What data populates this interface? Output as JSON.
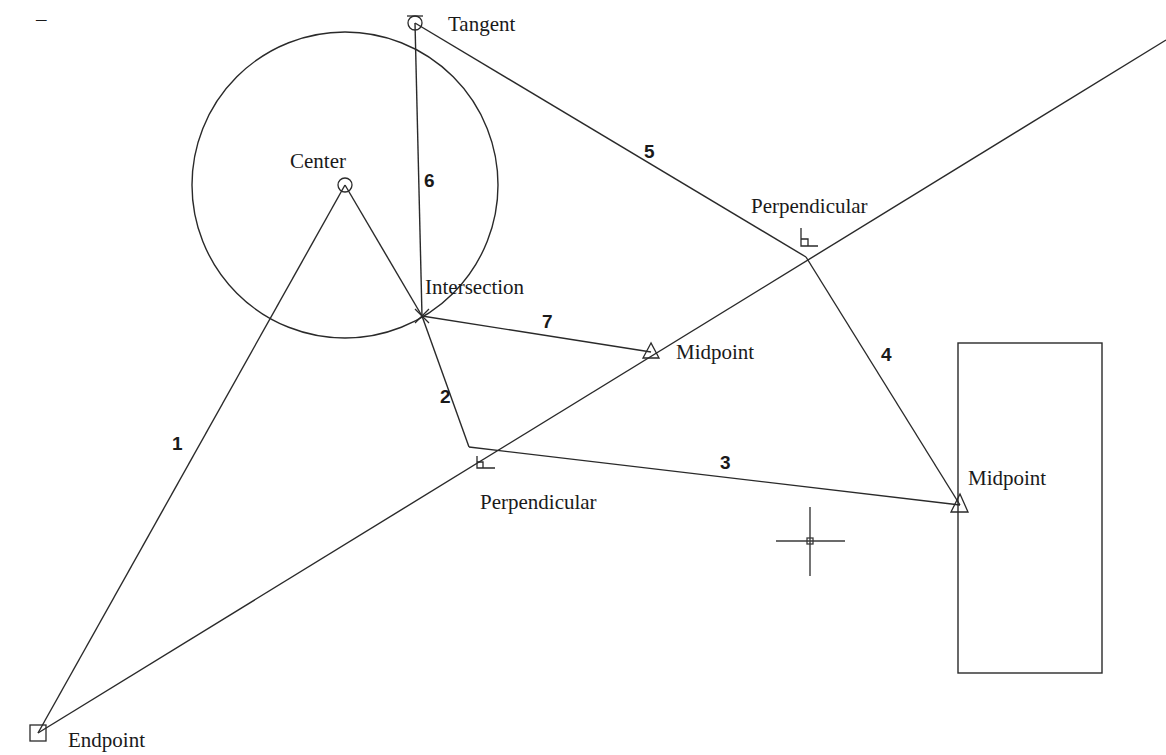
{
  "diagram": {
    "corner_mark": "–",
    "points": {
      "endpoint": {
        "label": "Endpoint",
        "x": 38,
        "y": 733,
        "marker": "square"
      },
      "center": {
        "label": "Center",
        "x": 345,
        "y": 185,
        "marker": "circle"
      },
      "tangent": {
        "label": "Tangent",
        "x": 415,
        "y": 23,
        "marker": "tangent-circle"
      },
      "intersection": {
        "label": "Intersection",
        "x": 422,
        "y": 316,
        "marker": "x"
      },
      "perpendicular_lower": {
        "label": "Perpendicular",
        "x": 469,
        "y": 447,
        "marker": "right-angle"
      },
      "perpendicular_upper": {
        "label": "Perpendicular",
        "x": 806,
        "y": 257,
        "marker": "right-angle"
      },
      "midpoint_line": {
        "label": "Midpoint",
        "x": 651,
        "y": 352,
        "marker": "triangle"
      },
      "midpoint_rect": {
        "label": "Midpoint",
        "x": 960,
        "y": 505,
        "marker": "triangle"
      }
    },
    "segments": [
      {
        "label": "1",
        "from": "endpoint",
        "to": "center"
      },
      {
        "label": "2",
        "from": "intersection",
        "to": "perpendicular_lower"
      },
      {
        "label": "3",
        "from": "perpendicular_lower",
        "to": "midpoint_rect"
      },
      {
        "label": "4",
        "from": "perpendicular_upper",
        "to": "midpoint_rect"
      },
      {
        "label": "5",
        "from": "tangent",
        "to": "perpendicular_upper"
      },
      {
        "label": "6",
        "from": "tangent",
        "to": "intersection"
      },
      {
        "label": "7",
        "from": "intersection",
        "to": "midpoint_line"
      }
    ],
    "circle": {
      "cx": 345,
      "cy": 185,
      "r": 153
    },
    "rectangle": {
      "x": 958,
      "y": 343,
      "width": 144,
      "height": 330
    },
    "cursor": {
      "x": 810,
      "y": 541
    }
  }
}
